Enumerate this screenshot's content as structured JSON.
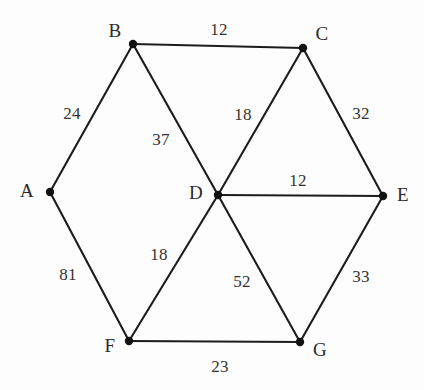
{
  "chart_data": {
    "type": "diagram",
    "title": "",
    "subtitle": "",
    "graph_kind": "undirected weighted graph",
    "nodes": [
      {
        "id": "A",
        "label": "A",
        "x": 50,
        "y": 192,
        "label_x": 27,
        "label_y": 190
      },
      {
        "id": "B",
        "label": "B",
        "x": 133,
        "y": 44,
        "label_x": 115,
        "label_y": 30
      },
      {
        "id": "C",
        "label": "C",
        "x": 303,
        "y": 48,
        "label_x": 322,
        "label_y": 33
      },
      {
        "id": "D",
        "label": "D",
        "x": 218,
        "y": 195,
        "label_x": 196,
        "label_y": 192
      },
      {
        "id": "E",
        "label": "E",
        "x": 383,
        "y": 196,
        "label_x": 403,
        "label_y": 194
      },
      {
        "id": "F",
        "label": "F",
        "x": 129,
        "y": 341,
        "label_x": 110,
        "label_y": 345
      },
      {
        "id": "G",
        "label": "G",
        "x": 300,
        "y": 342,
        "label_x": 320,
        "label_y": 349
      }
    ],
    "edges": [
      {
        "from": "A",
        "to": "B",
        "weight": 24,
        "label": "24",
        "label_x": 72,
        "label_y": 113
      },
      {
        "from": "B",
        "to": "C",
        "weight": 12,
        "label": "12",
        "label_x": 219,
        "label_y": 29
      },
      {
        "from": "B",
        "to": "D",
        "weight": 37,
        "label": "37",
        "label_x": 161,
        "label_y": 139
      },
      {
        "from": "C",
        "to": "D",
        "weight": 18,
        "label": "18",
        "label_x": 243,
        "label_y": 114
      },
      {
        "from": "C",
        "to": "E",
        "weight": 32,
        "label": "32",
        "label_x": 361,
        "label_y": 113
      },
      {
        "from": "D",
        "to": "E",
        "weight": 12,
        "label": "12",
        "label_x": 298,
        "label_y": 180
      },
      {
        "from": "A",
        "to": "F",
        "weight": 81,
        "label": "81",
        "label_x": 68,
        "label_y": 274
      },
      {
        "from": "D",
        "to": "F",
        "weight": 18,
        "label": "18",
        "label_x": 159,
        "label_y": 254
      },
      {
        "from": "D",
        "to": "G",
        "weight": 52,
        "label": "52",
        "label_x": 242,
        "label_y": 281
      },
      {
        "from": "E",
        "to": "G",
        "weight": 33,
        "label": "33",
        "label_x": 361,
        "label_y": 276
      },
      {
        "from": "F",
        "to": "G",
        "weight": 23,
        "label": "23",
        "label_x": 220,
        "label_y": 366
      }
    ],
    "colors": {
      "edge": "#1c1c1c",
      "node": "#121212",
      "text": "#2a2a2a",
      "background": "#fdfdfd"
    },
    "node_radius": 4.2,
    "legend": [],
    "annotations": []
  }
}
